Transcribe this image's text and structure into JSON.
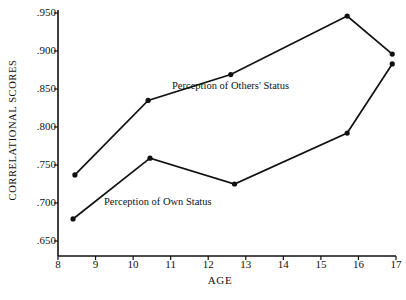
{
  "chart_data": {
    "type": "line",
    "title": "",
    "xlabel": "AGE",
    "ylabel": "CORRELATIONAL  SCORES",
    "xlim": [
      8,
      17
    ],
    "ylim": [
      0.65,
      0.95
    ],
    "grid": false,
    "legend_position": "inline-annotations",
    "xticks": [
      "8",
      "9",
      "10",
      "11",
      "12",
      "13",
      "14",
      "15",
      "16",
      "17"
    ],
    "xtick_values": [
      8,
      9,
      10,
      11,
      12,
      13,
      14,
      15,
      16,
      17
    ],
    "yticks": [
      ".950",
      ".900",
      ".850",
      ".800",
      ".750",
      ".700",
      ".650"
    ],
    "ytick_values": [
      0.95,
      0.9,
      0.85,
      0.8,
      0.75,
      0.7,
      0.65
    ],
    "marker": "filled-circle",
    "line_color": "#111111",
    "series": [
      {
        "name": "Perception of Others' Status",
        "x": [
          8.45,
          10.4,
          12.6,
          15.7,
          16.9
        ],
        "values": [
          0.737,
          0.835,
          0.869,
          0.946,
          0.896
        ]
      },
      {
        "name": "Perception of Own Status",
        "x": [
          8.4,
          10.45,
          12.7,
          15.7,
          16.9
        ],
        "values": [
          0.679,
          0.759,
          0.725,
          0.792,
          0.883
        ]
      }
    ],
    "annotations": [
      {
        "text": "Perception of Others' Status",
        "x": 12.0,
        "y": 0.852
      },
      {
        "text": "Perception of Own Status",
        "x": 10.2,
        "y": 0.7
      }
    ]
  }
}
